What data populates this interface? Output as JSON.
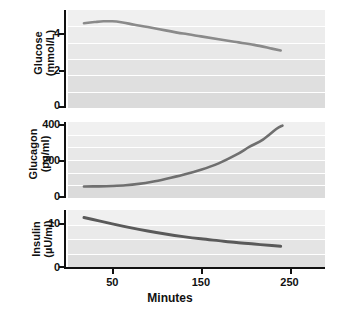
{
  "figure": {
    "width": 340,
    "height": 309,
    "background": "#ffffff"
  },
  "axis": {
    "xlabel": "Minutes",
    "xticks": [
      50,
      150,
      250
    ],
    "xtick_labels": [
      "50",
      "150",
      "250"
    ],
    "xlim": [
      0,
      290
    ]
  },
  "panels": [
    {
      "id": "glucose",
      "label_line1": "Glucose",
      "label_line2": "(mmol/L)",
      "yticks": [
        0,
        2,
        4
      ],
      "ytick_labels": [
        "0",
        "2",
        "4"
      ],
      "ylim": [
        0,
        5.2
      ],
      "line_color": "#8a8a8a"
    },
    {
      "id": "glucagon",
      "label_line1": "Glucagon",
      "label_line2": "(pg/ml)",
      "yticks": [
        0,
        200,
        400
      ],
      "ytick_labels": [
        "0",
        "200",
        "400"
      ],
      "ylim": [
        0,
        430
      ],
      "line_color": "#6f6f6f"
    },
    {
      "id": "insulin",
      "label_line1": "Insulin",
      "label_line2": "(µU/ml)",
      "yticks": [
        0,
        10
      ],
      "ytick_labels": [
        "0",
        "10"
      ],
      "ylim": [
        0,
        15.5
      ],
      "line_color": "#5a5a5a"
    }
  ],
  "chart_data": [
    {
      "type": "line",
      "title": "",
      "xlabel": "Minutes",
      "ylabel": "Glucose (mmol/L)",
      "xlim": [
        0,
        290
      ],
      "ylim": [
        0,
        5.2
      ],
      "xticks": [
        50,
        150,
        250
      ],
      "yticks": [
        0,
        2,
        4
      ],
      "grid": true,
      "legend": "none",
      "series": [
        {
          "name": "Glucose",
          "color": "#8a8a8a",
          "x": [
            18,
            30,
            40,
            50,
            60,
            75,
            90,
            110,
            130,
            150,
            170,
            190,
            210,
            230,
            240
          ],
          "values": [
            4.5,
            4.56,
            4.6,
            4.6,
            4.55,
            4.42,
            4.3,
            4.12,
            3.95,
            3.8,
            3.65,
            3.5,
            3.35,
            3.15,
            3.05
          ]
        }
      ]
    },
    {
      "type": "line",
      "title": "",
      "xlabel": "Minutes",
      "ylabel": "Glucagon (pg/ml)",
      "xlim": [
        0,
        290
      ],
      "ylim": [
        0,
        430
      ],
      "xticks": [
        50,
        150,
        250
      ],
      "yticks": [
        0,
        200,
        400
      ],
      "grid": true,
      "legend": "none",
      "series": [
        {
          "name": "Glucagon",
          "color": "#6f6f6f",
          "x": [
            18,
            35,
            50,
            65,
            80,
            95,
            110,
            130,
            150,
            170,
            190,
            205,
            220,
            235,
            242
          ],
          "values": [
            65,
            66,
            68,
            72,
            80,
            92,
            108,
            132,
            160,
            196,
            245,
            290,
            330,
            390,
            410
          ]
        }
      ]
    },
    {
      "type": "line",
      "title": "",
      "xlabel": "Minutes",
      "ylabel": "Insulin (µU/ml)",
      "xlim": [
        0,
        290
      ],
      "ylim": [
        0,
        15.5
      ],
      "xticks": [
        50,
        150,
        250
      ],
      "yticks": [
        0,
        10
      ],
      "grid": true,
      "legend": "none",
      "series": [
        {
          "name": "Insulin",
          "color": "#5a5a5a",
          "x": [
            18,
            35,
            50,
            70,
            90,
            110,
            130,
            150,
            170,
            190,
            210,
            230,
            240
          ],
          "values": [
            13.5,
            12.6,
            11.8,
            10.8,
            9.9,
            9.1,
            8.4,
            7.8,
            7.3,
            6.8,
            6.4,
            6.0,
            5.8
          ]
        }
      ]
    }
  ]
}
